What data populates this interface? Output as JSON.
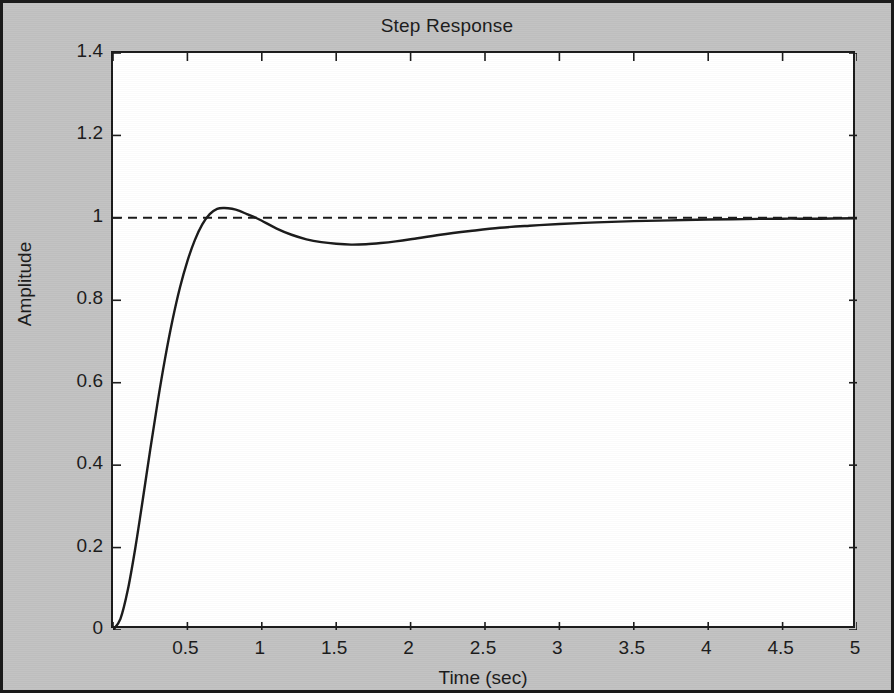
{
  "figure": {
    "title": "Step Response",
    "background_color": "#c2c2c2",
    "plot_background_color": "#ffffff",
    "border_color": "#1a1a1a"
  },
  "axes": {
    "xlabel": "Time (sec)",
    "ylabel": "Amplitude",
    "xticks": [
      "0",
      "0.5",
      "1",
      "1.5",
      "2",
      "2.5",
      "3",
      "3.5",
      "4",
      "4.5",
      "5"
    ],
    "yticks": [
      "0",
      "0.2",
      "0.4",
      "0.6",
      "0.8",
      "1",
      "1.2",
      "1.4"
    ]
  },
  "chart_data": {
    "type": "line",
    "title": "Step Response",
    "xlabel": "Time (sec)",
    "ylabel": "Amplitude",
    "xlim": [
      0,
      5
    ],
    "ylim": [
      0,
      1.4
    ],
    "xticks": [
      0,
      0.5,
      1,
      1.5,
      2,
      2.5,
      3,
      3.5,
      4,
      4.5,
      5
    ],
    "yticks": [
      0,
      0.2,
      0.4,
      0.6,
      0.8,
      1,
      1.2,
      1.4
    ],
    "grid": false,
    "legend": null,
    "tick_direction": "in",
    "box": true,
    "annotations": [
      {
        "type": "reference_line",
        "orientation": "horizontal",
        "value": 1,
        "style": "dashed",
        "color": "#1a1a1a",
        "label": "steady-state value"
      }
    ],
    "series": [
      {
        "name": "Step response",
        "color": "#1a1a1a",
        "style": "solid",
        "width": 2,
        "system": {
          "description": "second-order underdamped step response",
          "damping_ratio": 0.69,
          "natural_frequency": 5.0,
          "peak_amplitude": 1.023,
          "peak_time": 0.77,
          "overshoot_percent": 2.3,
          "trough_amplitude": 0.932,
          "trough_time": 1.33,
          "steady_state": 1.0
        },
        "x": [
          0,
          0.05,
          0.1,
          0.15,
          0.2,
          0.25,
          0.3,
          0.35,
          0.4,
          0.45,
          0.5,
          0.55,
          0.6,
          0.65,
          0.7,
          0.75,
          0.8,
          0.85,
          0.9,
          0.95,
          1,
          1.1,
          1.2,
          1.3,
          1.4,
          1.5,
          1.6,
          1.7,
          1.8,
          1.9,
          2,
          2.2,
          2.4,
          2.6,
          2.8,
          3,
          3.25,
          3.5,
          3.75,
          4,
          4.25,
          4.5,
          4.75,
          5
        ],
        "y": [
          0,
          0.027,
          0.098,
          0.199,
          0.316,
          0.437,
          0.553,
          0.659,
          0.752,
          0.831,
          0.895,
          0.946,
          0.984,
          1.009,
          1.022,
          1.024,
          1.022,
          1.017,
          1.009,
          1.002,
          0.993,
          0.974,
          0.959,
          0.948,
          0.941,
          0.937,
          0.935,
          0.936,
          0.939,
          0.943,
          0.948,
          0.959,
          0.968,
          0.976,
          0.981,
          0.985,
          0.989,
          0.992,
          0.994,
          0.996,
          0.997,
          0.998,
          0.998,
          0.999
        ]
      }
    ]
  }
}
